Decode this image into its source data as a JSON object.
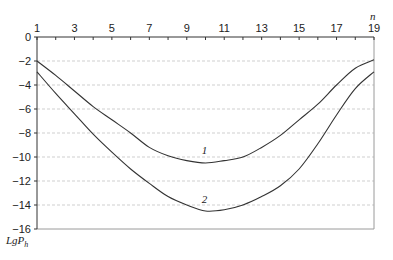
{
  "chart_data": {
    "type": "line",
    "title": "",
    "xlabel": "n",
    "ylabel": "LgP_h",
    "ylabel_main": "LgP",
    "ylabel_sub": "h",
    "x_axis_position": "top",
    "xlim": [
      1,
      19
    ],
    "ylim": [
      -16,
      0
    ],
    "x_tick_labels": [
      "1",
      "3",
      "5",
      "7",
      "9",
      "11",
      "13",
      "15",
      "17",
      "19"
    ],
    "y_tick_labels": [
      "0",
      "-2",
      "-4",
      "-6",
      "-8",
      "-10",
      "-12",
      "-14",
      "-16"
    ],
    "grid": "horizontal dashed",
    "x": [
      1,
      2,
      3,
      4,
      5,
      6,
      7,
      8,
      9,
      10,
      11,
      12,
      13,
      14,
      15,
      16,
      17,
      18,
      19
    ],
    "series": [
      {
        "name": "1",
        "values": [
          -2.0,
          -3.2,
          -4.5,
          -5.8,
          -6.9,
          -8.0,
          -9.2,
          -9.9,
          -10.3,
          -10.5,
          -10.3,
          -10.0,
          -9.2,
          -8.2,
          -6.9,
          -5.6,
          -4.0,
          -2.6,
          -1.9
        ]
      },
      {
        "name": "2",
        "values": [
          -2.9,
          -4.7,
          -6.4,
          -8.1,
          -9.6,
          -11.0,
          -12.2,
          -13.3,
          -14.0,
          -14.5,
          -14.4,
          -14.0,
          -13.3,
          -12.4,
          -11.0,
          -8.9,
          -6.5,
          -4.3,
          -2.9
        ]
      }
    ],
    "annotations": [
      {
        "text": "1",
        "x": 10,
        "y": -9.4
      },
      {
        "text": "2",
        "x": 10,
        "y": -13.5
      }
    ],
    "legend": "none (inline curve labels)"
  }
}
